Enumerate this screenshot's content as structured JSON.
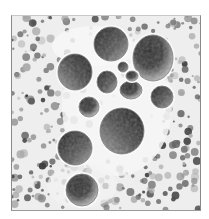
{
  "image": {
    "description": "Grayscale micrograph showing a cluster of large round cells with dark, grainy cytoplasm surrounded by smaller granular cells and debris",
    "colormap": "grayscale",
    "colors": {
      "background": "#ffffff",
      "cell_dark": "#1e1e1e",
      "cell_mid": "#6e6e6e",
      "cell_light": "#a8a8a8",
      "debris": "#7a7a7a",
      "clear_space": "#f4f4f4"
    },
    "large_cell_count": 12
  }
}
